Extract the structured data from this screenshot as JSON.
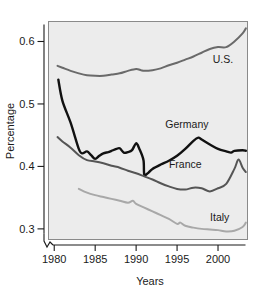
{
  "chart_data": {
    "type": "line",
    "title": "",
    "xlabel": "Years",
    "ylabel": "Percentage",
    "xlim": [
      1979.3,
      2003.6
    ],
    "ylim": [
      0.283,
      0.632
    ],
    "grid": false,
    "legend": "inline-labels",
    "axis_break": true,
    "xticks": [
      1980,
      1985,
      1990,
      1995,
      2000
    ],
    "xtick_labels": [
      "1980",
      "1985",
      "1990",
      "1995",
      "2000"
    ],
    "yticks": [
      0.3,
      0.4,
      0.5,
      0.6
    ],
    "ytick_labels": [
      "0.3",
      "0.4",
      "0.5",
      "0.6"
    ],
    "series": [
      {
        "name": "U.S.",
        "color": "#6a6a6a",
        "width": 2.0,
        "label_x": 2000.6,
        "label_y": 0.565,
        "x": [
          1980.4,
          1981,
          1982,
          1983,
          1984,
          1985,
          1986,
          1987,
          1988,
          1989,
          1990,
          1990.6,
          1991,
          1992,
          1993,
          1994,
          1995,
          1996,
          1997,
          1998,
          1999,
          2000,
          2001,
          2002,
          2003,
          2003.4
        ],
        "values": [
          0.561,
          0.558,
          0.553,
          0.549,
          0.546,
          0.545,
          0.545,
          0.547,
          0.549,
          0.553,
          0.556,
          0.554,
          0.553,
          0.554,
          0.557,
          0.562,
          0.566,
          0.571,
          0.576,
          0.582,
          0.588,
          0.591,
          0.591,
          0.6,
          0.613,
          0.621
        ]
      },
      {
        "name": "Germany",
        "color": "#111111",
        "width": 2.4,
        "label_x": 1996.2,
        "label_y": 0.462,
        "x": [
          1980.5,
          1981,
          1982,
          1983,
          1983.4,
          1984,
          1984.5,
          1985,
          1985.5,
          1986,
          1986.6,
          1987,
          1987.6,
          1988,
          1988.5,
          1989,
          1989.5,
          1990,
          1990.4,
          1990.9,
          1991,
          1991.5,
          1992,
          1993,
          1994,
          1995,
          1996,
          1997,
          1997.6,
          1998,
          1999,
          2000,
          2001,
          2001.6,
          2002,
          2003,
          2003.4
        ],
        "values": [
          0.539,
          0.505,
          0.47,
          0.428,
          0.421,
          0.424,
          0.418,
          0.412,
          0.417,
          0.421,
          0.423,
          0.425,
          0.428,
          0.429,
          0.422,
          0.423,
          0.426,
          0.437,
          0.428,
          0.41,
          0.387,
          0.39,
          0.396,
          0.403,
          0.409,
          0.417,
          0.428,
          0.441,
          0.446,
          0.443,
          0.435,
          0.428,
          0.424,
          0.422,
          0.425,
          0.426,
          0.425
        ]
      },
      {
        "name": "France",
        "color": "#555555",
        "width": 2.0,
        "label_x": 1996.0,
        "label_y": 0.398,
        "x": [
          1980.4,
          1981,
          1982,
          1983,
          1984,
          1985,
          1986,
          1987,
          1988,
          1989,
          1990,
          1991,
          1992,
          1993,
          1994,
          1995,
          1996,
          1997,
          1998,
          1999,
          2000,
          2001,
          2002,
          2002.5,
          2003,
          2003.4
        ],
        "values": [
          0.447,
          0.44,
          0.43,
          0.418,
          0.41,
          0.408,
          0.405,
          0.401,
          0.398,
          0.393,
          0.389,
          0.384,
          0.379,
          0.373,
          0.368,
          0.364,
          0.363,
          0.366,
          0.365,
          0.36,
          0.365,
          0.372,
          0.396,
          0.411,
          0.398,
          0.391
        ]
      },
      {
        "name": "Italy",
        "color": "#a8a8a8",
        "width": 2.0,
        "label_x": 2000.2,
        "label_y": 0.313,
        "x": [
          1983.0,
          1984,
          1985,
          1986,
          1987,
          1988,
          1989,
          1989.6,
          1990,
          1991,
          1992,
          1993,
          1994,
          1995,
          1995.4,
          1996,
          1997,
          1998,
          1999,
          2000,
          2001,
          2002,
          2003,
          2003.4
        ],
        "values": [
          0.364,
          0.358,
          0.354,
          0.351,
          0.348,
          0.345,
          0.342,
          0.345,
          0.34,
          0.334,
          0.328,
          0.322,
          0.316,
          0.308,
          0.31,
          0.305,
          0.302,
          0.3,
          0.299,
          0.298,
          0.296,
          0.297,
          0.303,
          0.31
        ]
      }
    ]
  }
}
